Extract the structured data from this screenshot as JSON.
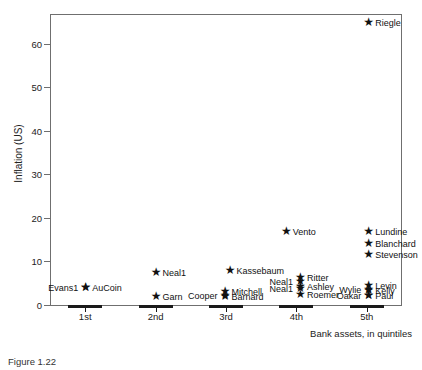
{
  "figure": {
    "caption": "Figure 1.22"
  },
  "chart_data": {
    "type": "scatter",
    "title": "",
    "xlabel": "Bank assets, in quintiles",
    "ylabel": "Inflation (US)",
    "xlim": [
      0.5,
      5.5
    ],
    "ylim": [
      0,
      67
    ],
    "grid": false,
    "legend": "none",
    "marker": "star",
    "categories": [
      "1st",
      "2nd",
      "3rd",
      "4th",
      "5th"
    ],
    "xtick_labels": [
      "1st",
      "2nd",
      "3rd",
      "4th",
      "5th"
    ],
    "ytick_labels": [
      "0",
      "10",
      "20",
      "30",
      "40",
      "50",
      "60"
    ],
    "ytick_values": [
      0,
      10,
      20,
      30,
      40,
      50,
      60
    ],
    "points": [
      {
        "label": "Evans1",
        "quintile": 1,
        "x": 1.0,
        "y": 4.2,
        "side": "left"
      },
      {
        "label": "AuCoin",
        "quintile": 1,
        "x": 1.0,
        "y": 4.2,
        "side": "right"
      },
      {
        "label": "Neal1",
        "quintile": 2,
        "x": 2.0,
        "y": 7.5,
        "side": "right"
      },
      {
        "label": "Garn",
        "quintile": 2,
        "x": 2.0,
        "y": 2.0,
        "side": "right"
      },
      {
        "label": "Kassebaum",
        "quintile": 3,
        "x": 3.05,
        "y": 8.0,
        "side": "right"
      },
      {
        "label": "Cooper",
        "quintile": 3,
        "x": 2.98,
        "y": 2.3,
        "side": "left"
      },
      {
        "label": "Mitchell",
        "quintile": 3,
        "x": 2.98,
        "y": 3.3,
        "side": "right"
      },
      {
        "label": "Barnard",
        "quintile": 3,
        "x": 2.98,
        "y": 2.0,
        "side": "right"
      },
      {
        "label": "Vento",
        "quintile": 4,
        "x": 3.85,
        "y": 17.0,
        "side": "right"
      },
      {
        "label": "Ritter",
        "quintile": 4,
        "x": 4.05,
        "y": 6.5,
        "side": "right"
      },
      {
        "label": "Neal1",
        "quintile": 4,
        "x": 4.05,
        "y": 5.6,
        "side": "left"
      },
      {
        "label": "Ashley",
        "quintile": 4,
        "x": 4.05,
        "y": 4.3,
        "side": "right"
      },
      {
        "label": "Neal1",
        "quintile": 4,
        "x": 4.05,
        "y": 3.9,
        "side": "left"
      },
      {
        "label": "Roemer",
        "quintile": 4,
        "x": 4.05,
        "y": 2.6,
        "side": "right"
      },
      {
        "label": "Riegle",
        "quintile": 5,
        "x": 5.02,
        "y": 65.0,
        "side": "right"
      },
      {
        "label": "Lundine",
        "quintile": 5,
        "x": 5.02,
        "y": 17.0,
        "side": "right"
      },
      {
        "label": "Blanchard",
        "quintile": 5,
        "x": 5.02,
        "y": 14.2,
        "side": "right"
      },
      {
        "label": "Stevenson",
        "quintile": 5,
        "x": 5.02,
        "y": 11.6,
        "side": "right"
      },
      {
        "label": "Levin",
        "quintile": 5,
        "x": 5.02,
        "y": 4.6,
        "side": "right"
      },
      {
        "label": "Wylie",
        "quintile": 5,
        "x": 5.02,
        "y": 3.6,
        "side": "left"
      },
      {
        "label": "Kelly",
        "quintile": 5,
        "x": 5.02,
        "y": 3.4,
        "side": "right"
      },
      {
        "label": "Oakar",
        "quintile": 5,
        "x": 5.02,
        "y": 2.3,
        "side": "left"
      },
      {
        "label": "Paul",
        "quintile": 5,
        "x": 5.02,
        "y": 2.2,
        "side": "right"
      }
    ],
    "marker_glyph": "★",
    "colors": {
      "marker": "#111111",
      "axis": "#6f6f6f",
      "text": "#222222"
    }
  }
}
